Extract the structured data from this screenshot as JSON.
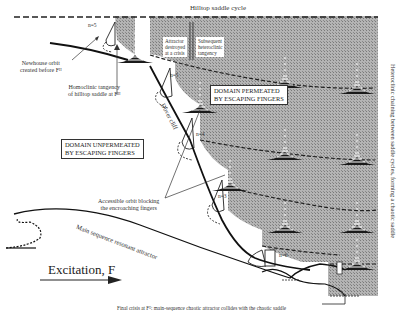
{
  "figure": {
    "title_top": "Hilltop saddle cycle",
    "right_vertical": "Heteroclinic chaining between saddle cycles, forming a chaotic saddle",
    "labels": {
      "newhouse": [
        "Newhouse orbit",
        "created before Fᴴ"
      ],
      "homoclinic": [
        "Homoclinic tangency",
        "of hilltop saddle at Fᴴ"
      ],
      "attractor_destroyed": [
        "Attractor",
        "destroyed",
        "at a crisis"
      ],
      "subsequent": [
        "Subsequent",
        "heteroclinic",
        "tangency"
      ],
      "domain_permeated": [
        "DOMAIN PERMEATED",
        "BY ESCAPING FINGERS"
      ],
      "domain_unpermeated": [
        "DOMAIN UNPERMEATED",
        "BY ESCAPING FINGERS"
      ],
      "dover_cliff": "Dover cliff",
      "accessible_orbit": [
        "Accessible orbit blocking",
        "the encroaching fingers"
      ],
      "main_sequence": "Main sequence resonant attractor",
      "excitation": "Excitation, F",
      "final_crisis": "Final crisis at Fᴱ: main-sequence chaotic attractor collides with the chaotic saddle"
    },
    "n_labels": [
      "n=5",
      "n=5",
      "n=4",
      "n=3",
      "n=6"
    ],
    "colors": {
      "shaded": "#a9a9a9",
      "ink": "#1a1a1a",
      "background": "#ffffff"
    }
  }
}
